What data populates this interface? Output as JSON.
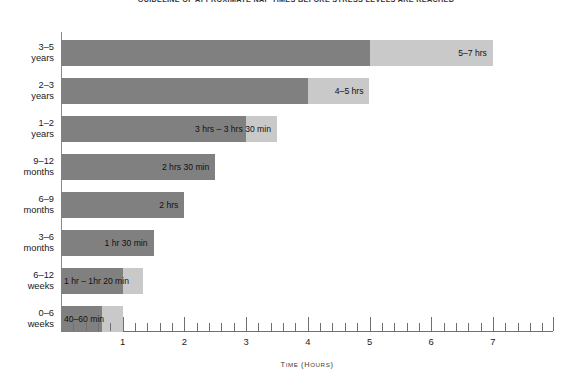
{
  "chart_data": {
    "type": "bar",
    "orientation": "horizontal",
    "title": "GUIDELINE OF APPROXIMATE NAP TIMES BEFORE STRESS LEVELS ARE REACHED",
    "xlabel": "TIME (HOURS)",
    "ylabel": "",
    "xlim": [
      0,
      7.97
    ],
    "grid": false,
    "legend": false,
    "categories": [
      "3–5 years",
      "2–3 years",
      "1–2 years",
      "9–12 months",
      "6–9 months",
      "3–6 months",
      "6–12 weeks",
      "0–6 weeks"
    ],
    "xticks": [
      1,
      2,
      3,
      4,
      5,
      6,
      7
    ],
    "xtick_labels": [
      "1",
      "2",
      "3",
      "4",
      "5",
      "6",
      "7"
    ],
    "minor_tick_interval": 0.2,
    "colors": {
      "lower_bound": "#808080",
      "upper_bound": "#c9c9c9",
      "axis": "#6f6f6f",
      "background": "#ffffff",
      "text": "#1a1a1a"
    },
    "series": [
      {
        "name": "Lower bound (hours)",
        "color": "#808080",
        "values": [
          5,
          4,
          3,
          2.5,
          2,
          1.5,
          1,
          0.667
        ]
      },
      {
        "name": "Upper bound (hours)",
        "color": "#c9c9c9",
        "values": [
          7,
          5,
          3.5,
          2.5,
          2,
          1.5,
          1.333,
          1
        ]
      }
    ],
    "bars": [
      {
        "category": "3–5 years",
        "label": "5–7 hrs",
        "low": 5,
        "high": 7,
        "label_align": "right"
      },
      {
        "category": "2–3 years",
        "label": "4–5 hrs",
        "low": 4,
        "high": 5,
        "label_align": "right"
      },
      {
        "category": "1–2 years",
        "label": "3 hrs – 3 hrs 30 min",
        "low": 3,
        "high": 3.5,
        "label_align": "right"
      },
      {
        "category": "9–12 months",
        "label": "2 hrs 30 min",
        "low": 2.5,
        "high": 2.5,
        "label_align": "right"
      },
      {
        "category": "6–9 months",
        "label": "2 hrs",
        "low": 2,
        "high": 2,
        "label_align": "right"
      },
      {
        "category": "3–6 months",
        "label": "1 hr 30 min",
        "low": 1.5,
        "high": 1.5,
        "label_align": "right"
      },
      {
        "category": "6–12 weeks",
        "label": "1 hr – 1hr 20 min",
        "low": 1,
        "high": 1.333,
        "label_align": "left"
      },
      {
        "category": "0–6 weeks",
        "label": "40–60 min",
        "low": 0.667,
        "high": 1,
        "label_align": "left"
      }
    ]
  }
}
